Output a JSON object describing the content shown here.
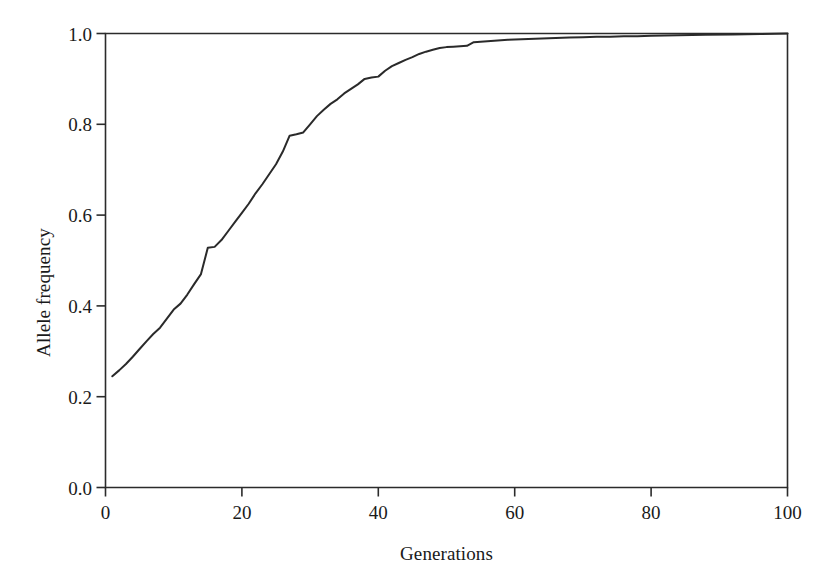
{
  "chart_data": {
    "type": "line",
    "title": "",
    "xlabel": "Generations",
    "ylabel": "Allele frequency",
    "xlim": [
      0,
      100
    ],
    "ylim": [
      0.0,
      1.0
    ],
    "xticks": [
      0,
      20,
      40,
      60,
      80,
      100
    ],
    "yticks": [
      0.0,
      0.2,
      0.4,
      0.6,
      0.8,
      1.0
    ],
    "xtick_labels": [
      "0",
      "20",
      "40",
      "60",
      "80",
      "100"
    ],
    "ytick_labels": [
      "0.0",
      "0.2",
      "0.4",
      "0.6",
      "0.8",
      "1.0"
    ],
    "grid": false,
    "legend": null,
    "line_color": "#2a2a2a",
    "background_color": "#ffffff",
    "axes_color": "#2b2b2b",
    "series": [
      {
        "name": "Allele frequency",
        "x": [
          1,
          2,
          3,
          4,
          5,
          6,
          7,
          8,
          9,
          10,
          11,
          12,
          13,
          14,
          15,
          16,
          17,
          18,
          19,
          20,
          21,
          22,
          23,
          24,
          25,
          26,
          27,
          28,
          29,
          30,
          31,
          32,
          33,
          34,
          35,
          36,
          37,
          38,
          39,
          40,
          41,
          42,
          43,
          44,
          45,
          46,
          47,
          48,
          49,
          50,
          51,
          52,
          53,
          54,
          55,
          56,
          57,
          58,
          59,
          60,
          62,
          64,
          66,
          68,
          70,
          72,
          74,
          76,
          78,
          80,
          84,
          88,
          92,
          96,
          100
        ],
        "y": [
          0.245,
          0.258,
          0.272,
          0.288,
          0.305,
          0.322,
          0.338,
          0.352,
          0.372,
          0.392,
          0.405,
          0.425,
          0.448,
          0.47,
          0.528,
          0.53,
          0.545,
          0.565,
          0.585,
          0.605,
          0.625,
          0.648,
          0.668,
          0.69,
          0.712,
          0.74,
          0.775,
          0.778,
          0.782,
          0.8,
          0.818,
          0.832,
          0.845,
          0.855,
          0.868,
          0.878,
          0.888,
          0.9,
          0.903,
          0.905,
          0.918,
          0.928,
          0.935,
          0.942,
          0.948,
          0.955,
          0.96,
          0.964,
          0.968,
          0.97,
          0.971,
          0.972,
          0.973,
          0.981,
          0.982,
          0.983,
          0.984,
          0.985,
          0.986,
          0.987,
          0.988,
          0.989,
          0.99,
          0.991,
          0.992,
          0.993,
          0.993,
          0.994,
          0.994,
          0.995,
          0.996,
          0.997,
          0.998,
          0.999,
          1.0
        ]
      }
    ]
  }
}
